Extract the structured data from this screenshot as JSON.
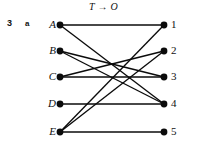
{
  "figure": {
    "prefix_number": "3",
    "prefix_letter": "a",
    "title": "T → O",
    "title_from": "T",
    "title_arrow": "→",
    "title_to": "O"
  },
  "colors": {
    "ink": "#0b0b0b",
    "background": "#ffffff"
  },
  "chart_data": {
    "type": "diagram",
    "subtype": "bipartite-graph",
    "title": "T → O",
    "left_set_label": "T",
    "right_set_label": "O",
    "left_nodes": [
      {
        "id": "A",
        "label": "A",
        "x": 60,
        "y": 25
      },
      {
        "id": "B",
        "label": "B",
        "x": 60,
        "y": 51
      },
      {
        "id": "C",
        "label": "C",
        "x": 60,
        "y": 77
      },
      {
        "id": "D",
        "label": "D",
        "x": 60,
        "y": 104
      },
      {
        "id": "E",
        "label": "E",
        "x": 60,
        "y": 132
      }
    ],
    "right_nodes": [
      {
        "id": "1",
        "label": "1",
        "x": 164,
        "y": 25
      },
      {
        "id": "2",
        "label": "2",
        "x": 164,
        "y": 51
      },
      {
        "id": "3",
        "label": "3",
        "x": 164,
        "y": 77
      },
      {
        "id": "4",
        "label": "4",
        "x": 164,
        "y": 104
      },
      {
        "id": "5",
        "label": "5",
        "x": 164,
        "y": 132
      }
    ],
    "edges": [
      {
        "from": "A",
        "to": "1"
      },
      {
        "from": "A",
        "to": "4"
      },
      {
        "from": "B",
        "to": "3"
      },
      {
        "from": "B",
        "to": "4"
      },
      {
        "from": "C",
        "to": "2"
      },
      {
        "from": "C",
        "to": "3"
      },
      {
        "from": "D",
        "to": "4"
      },
      {
        "from": "E",
        "to": "1"
      },
      {
        "from": "E",
        "to": "2"
      },
      {
        "from": "E",
        "to": "5"
      }
    ],
    "left_degrees": {
      "A": 2,
      "B": 2,
      "C": 2,
      "D": 1,
      "E": 3
    },
    "right_degrees": {
      "1": 2,
      "2": 2,
      "3": 2,
      "4": 3,
      "5": 1
    },
    "edge_count": 10,
    "node_radius": 3.4,
    "legend": [],
    "grid": false
  }
}
